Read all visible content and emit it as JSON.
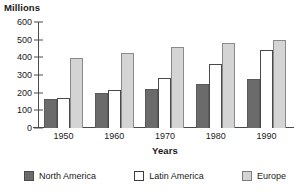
{
  "chart_data": {
    "type": "bar",
    "title": "",
    "ylabel": "Millions",
    "xlabel": "Years",
    "categories": [
      "1950",
      "1960",
      "1970",
      "1980",
      "1990"
    ],
    "series": [
      {
        "name": "North America",
        "color": "#6b6b6b",
        "values": [
          165,
          198,
          220,
          248,
          278
        ]
      },
      {
        "name": "Latin America",
        "color": "#ffffff",
        "values": [
          168,
          215,
          285,
          360,
          440
        ]
      },
      {
        "name": "Europe",
        "color": "#d4d4d4",
        "values": [
          395,
          425,
          460,
          480,
          500
        ]
      }
    ],
    "ylim": [
      0,
      600
    ],
    "ytick_step": 100,
    "yticks": [
      "600",
      "500",
      "400",
      "300",
      "200",
      "100",
      "0"
    ],
    "grid": false,
    "legend_position": "bottom"
  },
  "legend": {
    "items": [
      {
        "label": "North America",
        "swatch": "north-america"
      },
      {
        "label": "Latin America",
        "swatch": "latin-america"
      },
      {
        "label": "Europe",
        "swatch": "europe"
      }
    ]
  }
}
